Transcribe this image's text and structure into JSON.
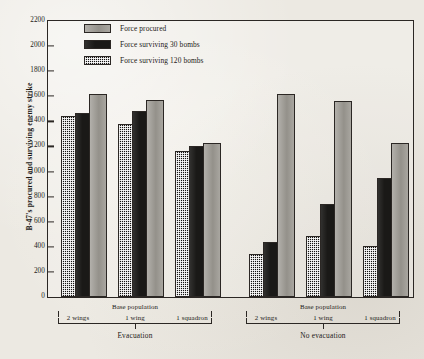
{
  "chart_data": {
    "type": "bar",
    "title": "",
    "xlabel": "Base population",
    "ylabel": "B-47's procured and surviving enemy strike",
    "ylim": [
      0,
      2200
    ],
    "ytick_step": 200,
    "yticks": [
      "2200",
      "2000",
      "1800",
      "1600",
      "1400",
      "1200",
      "1000",
      "800",
      "600",
      "400",
      "200",
      "0"
    ],
    "grid": false,
    "legend_position": "top-center",
    "series": [
      {
        "name": "Force procured",
        "key": "procured",
        "fill": "gray",
        "values": [
          1620,
          1570,
          1230,
          1620,
          1560,
          1230
        ]
      },
      {
        "name": "Force surviving 30 bombs",
        "key": "bombs30",
        "fill": "black",
        "values": [
          1465,
          1485,
          1205,
          435,
          740,
          950
        ]
      },
      {
        "name": "Force surviving 120 bombs",
        "key": "bombs120",
        "fill": "check",
        "values": [
          1440,
          1380,
          1165,
          345,
          490,
          410
        ]
      }
    ],
    "categories": [
      "2 wings",
      "1 wing",
      "1 squadron",
      "2 wings",
      "1 wing",
      "1 squadron"
    ],
    "panels": [
      {
        "label": "Evacuation",
        "sublabel": "Base population",
        "categories": [
          "2 wings",
          "1 wing",
          "1 squadron"
        ]
      },
      {
        "label": "No evacuation",
        "sublabel": "Base population",
        "categories": [
          "2 wings",
          "1 wing",
          "1 squadron"
        ]
      }
    ],
    "bar_order_within_group": [
      "Force surviving 120 bombs",
      "Force surviving 30 bombs",
      "Force procured"
    ]
  },
  "legend": {
    "items": [
      {
        "label": "Force procured",
        "swatch": "swatch-gray"
      },
      {
        "label": "Force surviving 30 bombs",
        "swatch": "swatch-black"
      },
      {
        "label": "Force surviving 120 bombs",
        "swatch": "swatch-checkered"
      }
    ]
  },
  "axis": {
    "y_title": "B-47's procured and surviving enemy strike",
    "y_ticks": [
      "2200",
      "2000",
      "1800",
      "1600",
      "1400",
      "1200",
      "1000",
      "800",
      "600",
      "400",
      "200",
      "0"
    ]
  },
  "panels": {
    "left": {
      "title": "Evacuation",
      "base_population": "Base population",
      "cats": [
        "2 wings",
        "1 wing",
        "1 squadron"
      ]
    },
    "right": {
      "title": "No evacuation",
      "base_population": "Base population",
      "cats": [
        "2 wings",
        "1 wing",
        "1 squadron"
      ]
    }
  },
  "colors": {
    "procured": "#9d9a93",
    "bombs30": "#1a1917",
    "bombs120": "#151412",
    "axis": "#2b2724",
    "paper": "#ece9e2"
  }
}
